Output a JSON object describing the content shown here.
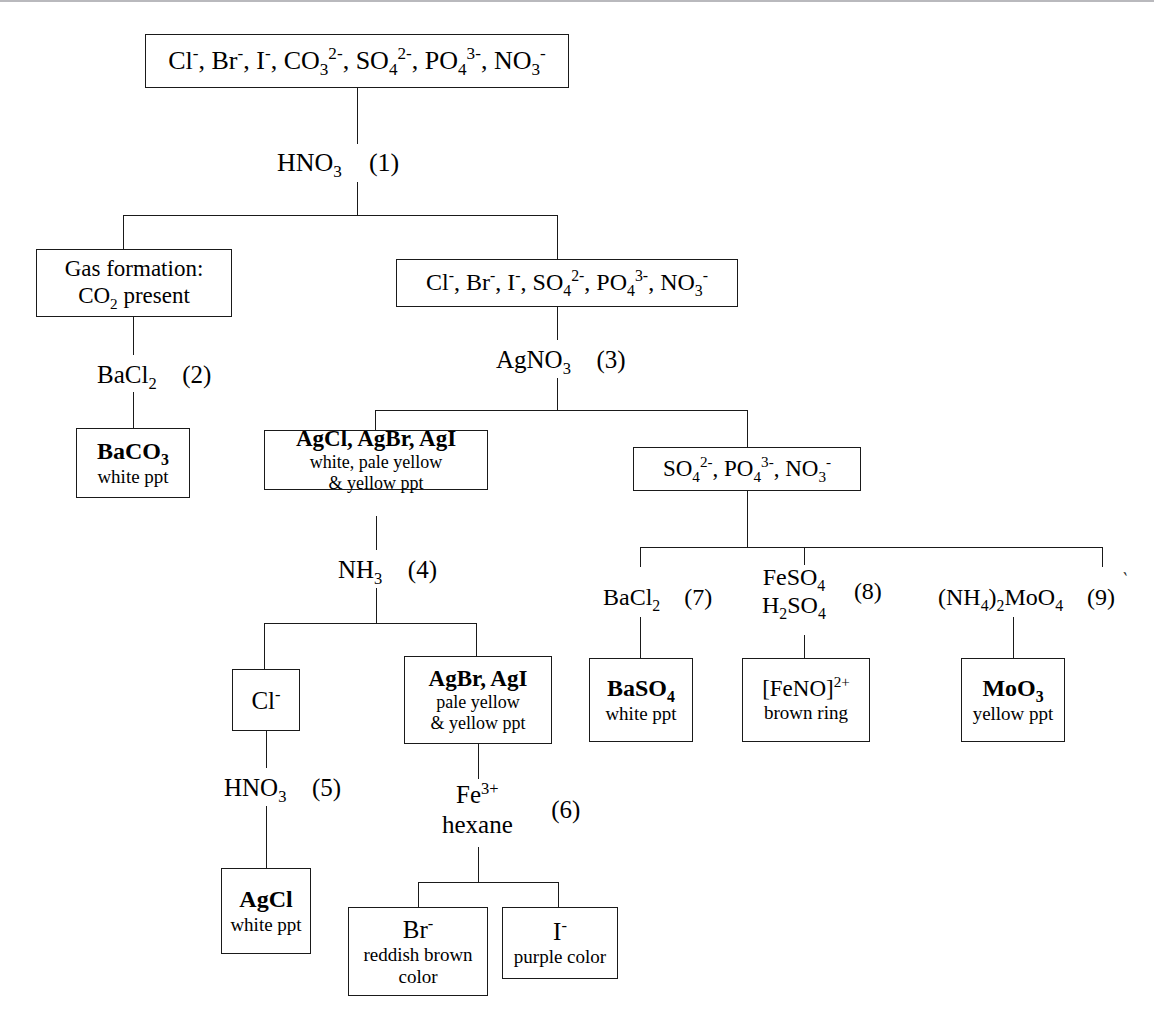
{
  "diagram": {
    "line_color": "#1a1a1a",
    "background": "#ffffff"
  },
  "nodes": {
    "root": {
      "formula_html": "Cl<sup>-</sup>, Br<sup>-</sup>, I<sup>-</sup>, CO<sub>3</sub><sup>2-</sup>, SO<sub>4</sub><sup>2-</sup>, PO<sub>4</sub><sup>3-</sup>, NO<sub>3</sub><sup>-</sup>",
      "formula_text": "Cl-, Br-, I-, CO3 2-, SO4 2-, PO4 3-, NO3-"
    },
    "gas": {
      "line1": "Gas formation:",
      "line2_html": "CO<sub>2</sub> present",
      "line2_text": "CO2 present"
    },
    "after_hno3": {
      "formula_html": "Cl<sup>-</sup>, Br<sup>-</sup>, I<sup>-</sup>, SO<sub>4</sub><sup>2-</sup>, PO<sub>4</sub><sup>3-</sup>, NO<sub>3</sub><sup>-</sup>",
      "formula_text": "Cl-, Br-, I-, SO4 2-, PO4 3-, NO3-"
    },
    "baco3": {
      "formula_html": "BaCO<sub>3</sub>",
      "formula_text": "BaCO3",
      "desc": "white ppt"
    },
    "silver_halides": {
      "formula_html": "AgCl, AgBr, AgI",
      "formula_text": "AgCl, AgBr, AgI",
      "desc1": "white, pale yellow",
      "desc2": "& yellow ppt"
    },
    "oxyanions": {
      "formula_html": "SO<sub>4</sub><sup>2-</sup>, PO<sub>4</sub><sup>3-</sup>, NO<sub>3</sub><sup>-</sup>",
      "formula_text": "SO4 2-, PO4 3-, NO3-"
    },
    "chloride": {
      "formula_html": "Cl<sup>-</sup>",
      "formula_text": "Cl-"
    },
    "agbr_agi": {
      "formula_html": "AgBr, AgI",
      "formula_text": "AgBr, AgI",
      "desc1": "pale yellow",
      "desc2": "& yellow ppt"
    },
    "baso4": {
      "formula_html": "BaSO<sub>4</sub>",
      "formula_text": "BaSO4",
      "desc": "white ppt"
    },
    "feno": {
      "formula_html": "[FeNO]<sup>2+</sup>",
      "formula_text": "[FeNO]2+",
      "desc": "brown ring"
    },
    "moo3": {
      "formula_html": "MoO<sub>3</sub>",
      "formula_text": "MoO3",
      "desc": "yellow ppt"
    },
    "agcl": {
      "formula_html": "AgCl",
      "formula_text": "AgCl",
      "desc": "white ppt"
    },
    "bromide": {
      "formula_html": "Br<sup>-</sup>",
      "formula_text": "Br-",
      "desc1": "reddish brown",
      "desc2": "color"
    },
    "iodide": {
      "formula_html": "I<sup>-</sup>",
      "formula_text": "I-",
      "desc": "purple color"
    }
  },
  "reagents": {
    "step1": {
      "formula_html": "HNO<sub>3</sub>",
      "formula_text": "HNO3",
      "number": "(1)"
    },
    "step2": {
      "formula_html": "BaCl<sub>2</sub>",
      "formula_text": "BaCl2",
      "number": "(2)"
    },
    "step3": {
      "formula_html": "AgNO<sub>3</sub>",
      "formula_text": "AgNO3",
      "number": "(3)"
    },
    "step4": {
      "formula_html": "NH<sub>3</sub>",
      "formula_text": "NH3",
      "number": "(4)"
    },
    "step5": {
      "formula_html": "HNO<sub>3</sub>",
      "formula_text": "HNO3",
      "number": "(5)"
    },
    "step6": {
      "line1_html": "Fe<sup>3+</sup>",
      "line1_text": "Fe3+",
      "line2": "hexane",
      "number": "(6)"
    },
    "step7": {
      "formula_html": "BaCl<sub>2</sub>",
      "formula_text": "BaCl2",
      "number": "(7)"
    },
    "step8": {
      "line1_html": "FeSO<sub>4</sub>",
      "line1_text": "FeSO4",
      "line2_html": "H<sub>2</sub>SO<sub>4</sub>",
      "line2_text": "H2SO4",
      "number": "(8)"
    },
    "step9": {
      "formula_html": "(NH<sub>4</sub>)<sub>2</sub>MoO<sub>4</sub>",
      "formula_text": "(NH4)2MoO4",
      "number": "(9)"
    }
  }
}
